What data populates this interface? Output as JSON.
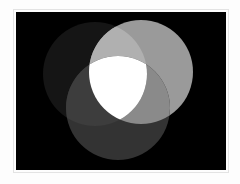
{
  "figure": {
    "background_color": "#fdfdfd",
    "panel_background_color": "#000000",
    "panel": {
      "x": 16,
      "y": 12,
      "width": 210,
      "height": 158
    }
  },
  "chart_data": {
    "type": "venn",
    "subtitle": "",
    "xlabel": "",
    "ylabel": "",
    "grid": false,
    "legend_position": "none",
    "colorspace": "grayscale",
    "blend_mode": "additive",
    "background": "#000000",
    "sets": [
      {
        "name": "Set A",
        "position": "left",
        "fill": "#151515",
        "gray_value": 21,
        "cx": 95,
        "cy": 74,
        "r": 52
      },
      {
        "name": "Set B",
        "position": "right",
        "fill": "#9a9a9a",
        "gray_value": 154,
        "cx": 141,
        "cy": 72,
        "r": 52
      },
      {
        "name": "Set C",
        "position": "bottom",
        "fill": "#333333",
        "gray_value": 51,
        "cx": 118,
        "cy": 108,
        "r": 52
      }
    ],
    "intersections": [
      {
        "name": "A ∩ B",
        "members": [
          "Set A",
          "Set B"
        ],
        "fill": "#b0b0b0",
        "gray_value": 176
      },
      {
        "name": "B ∩ C",
        "members": [
          "Set B",
          "Set C"
        ],
        "fill": "#8a8a8a",
        "gray_value": 138
      },
      {
        "name": "A ∩ C",
        "members": [
          "Set A",
          "Set C"
        ],
        "fill": "#3d3d3d",
        "gray_value": 61
      },
      {
        "name": "A ∩ B ∩ C",
        "members": [
          "Set A",
          "Set B",
          "Set C"
        ],
        "fill": "#ffffff",
        "gray_value": 255
      }
    ],
    "annotations": []
  }
}
